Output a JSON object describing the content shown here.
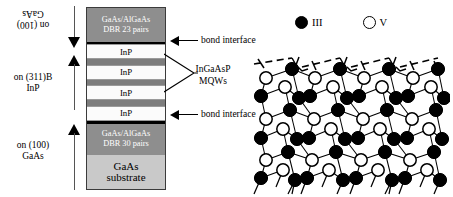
{
  "figure": {
    "left_panel": {
      "orientation_labels": [
        {
          "id": "top",
          "text": "on (100)\nGaAs",
          "flipped": true
        },
        {
          "id": "middle",
          "text": "on (311)B\nInP",
          "flipped": false
        },
        {
          "id": "bottom",
          "text": "on (100)\nGaAs",
          "flipped": false
        }
      ],
      "arrows": [
        {
          "id": "growth-arrow-top",
          "direction": "down"
        },
        {
          "id": "growth-arrow-middle",
          "direction": "up"
        },
        {
          "id": "growth-arrow-bottom",
          "direction": "up"
        }
      ],
      "stack_layers": [
        {
          "id": "dbr-top",
          "kind": "dbr",
          "text": "GaAs/AlGaAs\nDBR 23 pairs"
        },
        {
          "id": "inp-1",
          "kind": "inp",
          "text": "InP"
        },
        {
          "id": "mqw-1",
          "kind": "mqw",
          "text": ""
        },
        {
          "id": "inp-2",
          "kind": "inp",
          "text": "InP"
        },
        {
          "id": "mqw-2",
          "kind": "mqw",
          "text": ""
        },
        {
          "id": "inp-3",
          "kind": "inp",
          "text": "InP"
        },
        {
          "id": "mqw-3",
          "kind": "mqw",
          "text": ""
        },
        {
          "id": "inp-4",
          "kind": "inp",
          "text": "InP"
        },
        {
          "id": "dbr-bottom",
          "kind": "dbr",
          "text": "GaAs/AlGaAs\nDBR 30 pairs"
        },
        {
          "id": "gaas-substrate",
          "kind": "sub",
          "text": "GaAs\nsubstrate"
        }
      ],
      "callouts": [
        {
          "id": "bond-interface-top",
          "text": "bond interface"
        },
        {
          "id": "bond-interface-bottom",
          "text": "bond interface"
        }
      ],
      "mqw_callout": {
        "text": "InGaAsP\nMQWs"
      }
    },
    "right_panel": {
      "legend": [
        {
          "id": "group-iii",
          "marker": "filled-circle",
          "label": "III"
        },
        {
          "id": "group-v",
          "marker": "open-circle",
          "label": "V"
        }
      ],
      "lattice": {
        "description": "stepped (311)B zincblende surface",
        "group_iii_color": "#000000",
        "group_v_color": "#ffffff",
        "bond_color": "#000000",
        "step_line_style": "dashed"
      }
    }
  }
}
